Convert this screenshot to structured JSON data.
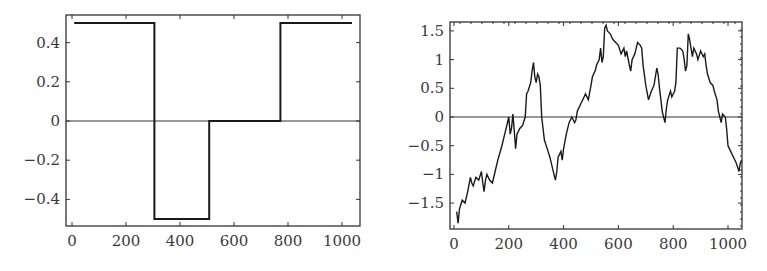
{
  "chart_data": [
    {
      "type": "line",
      "title": "",
      "xlabel": "",
      "ylabel": "",
      "xlim": [
        -20,
        1060
      ],
      "ylim": [
        -0.55,
        0.55
      ],
      "grid": false,
      "legend": null,
      "xticks": [
        0,
        200,
        400,
        600,
        800,
        1000
      ],
      "xtick_labels": [
        "0",
        "200",
        "400",
        "600",
        "800",
        "1000"
      ],
      "yticks": [
        0.4,
        0.2,
        0,
        -0.2,
        -0.4
      ],
      "ytick_labels": [
        "0.4",
        "0.2",
        "0",
        "−0.2",
        "−0.4"
      ],
      "reference_line_y": 0,
      "series": [
        {
          "name": "step signal",
          "style": "step",
          "x": [
            8,
            305,
            305,
            508,
            508,
            772,
            772,
            1037
          ],
          "y": [
            0.5,
            0.5,
            -0.5,
            -0.5,
            0,
            0,
            0.5,
            0.5
          ]
        }
      ]
    },
    {
      "type": "line",
      "title": "",
      "xlabel": "",
      "ylabel": "",
      "xlim": [
        -10,
        1050
      ],
      "ylim": [
        -1.95,
        1.7
      ],
      "grid": false,
      "legend": null,
      "xticks": [
        0,
        200,
        400,
        600,
        800,
        1000
      ],
      "xtick_labels": [
        "0",
        "200",
        "400",
        "600",
        "800",
        "1000"
      ],
      "yticks": [
        1.5,
        1,
        0.5,
        0,
        -0.5,
        -1,
        -1.5
      ],
      "ytick_labels": [
        "1.5",
        "1",
        "0.5",
        "0",
        "−0.5",
        "−1",
        "−1.5"
      ],
      "reference_line_y": 0,
      "series": [
        {
          "name": "random walk",
          "style": "line",
          "x": [
            10,
            15,
            20,
            30,
            40,
            50,
            60,
            65,
            70,
            80,
            90,
            100,
            105,
            110,
            115,
            120,
            130,
            140,
            150,
            160,
            175,
            185,
            190,
            200,
            205,
            210,
            215,
            220,
            225,
            230,
            240,
            250,
            260,
            265,
            270,
            280,
            285,
            290,
            295,
            300,
            305,
            310,
            315,
            320,
            330,
            340,
            350,
            360,
            370,
            375,
            380,
            390,
            395,
            400,
            410,
            420,
            430,
            440,
            445,
            450,
            460,
            470,
            480,
            490,
            500,
            505,
            515,
            520,
            530,
            535,
            540,
            545,
            550,
            555,
            560,
            570,
            580,
            590,
            600,
            610,
            620,
            625,
            630,
            640,
            645,
            650,
            660,
            670,
            680,
            685,
            690,
            700,
            710,
            720,
            730,
            740,
            745,
            750,
            755,
            760,
            770,
            775,
            780,
            790,
            795,
            800,
            805,
            810,
            815,
            825,
            835,
            840,
            845,
            850,
            855,
            860,
            870,
            875,
            885,
            890,
            900,
            910,
            915,
            920,
            925,
            935,
            945,
            950,
            960,
            965,
            975,
            980,
            990,
            995,
            1000,
            1010,
            1020,
            1030,
            1040,
            1045,
            1050
          ],
          "y": [
            -1.65,
            -1.85,
            -1.6,
            -1.45,
            -1.5,
            -1.3,
            -1.05,
            -1.15,
            -1.2,
            -1.05,
            -1.1,
            -0.95,
            -1.15,
            -1.3,
            -1.1,
            -1.0,
            -1.1,
            -1.15,
            -0.95,
            -0.75,
            -0.5,
            -0.3,
            -0.2,
            0.0,
            -0.3,
            -0.2,
            0.05,
            -0.25,
            -0.55,
            -0.3,
            -0.2,
            -0.15,
            0.0,
            0.4,
            0.45,
            0.6,
            0.8,
            0.95,
            0.7,
            0.6,
            0.75,
            0.7,
            0.55,
            0.0,
            -0.4,
            -0.55,
            -0.7,
            -0.9,
            -1.1,
            -0.95,
            -0.7,
            -0.6,
            -0.75,
            -0.55,
            -0.3,
            -0.1,
            0.0,
            -0.1,
            -0.05,
            0.1,
            0.2,
            0.3,
            0.4,
            0.3,
            0.55,
            0.7,
            0.8,
            0.9,
            1.0,
            1.2,
            0.95,
            1.05,
            1.55,
            1.6,
            1.5,
            1.45,
            1.35,
            1.3,
            1.25,
            1.1,
            1.2,
            1.05,
            1.15,
            0.9,
            0.8,
            1.0,
            1.1,
            1.3,
            1.25,
            1.2,
            0.9,
            0.55,
            0.3,
            0.45,
            0.55,
            0.85,
            0.75,
            0.5,
            0.3,
            0.1,
            -0.1,
            0.15,
            0.3,
            0.45,
            0.35,
            0.4,
            0.45,
            0.6,
            1.2,
            1.2,
            1.15,
            1.0,
            0.8,
            0.9,
            1.45,
            1.35,
            1.05,
            1.2,
            1.1,
            1.0,
            1.15,
            1.05,
            1.1,
            0.9,
            0.75,
            0.6,
            0.55,
            0.45,
            0.3,
            0.1,
            -0.1,
            0.05,
            0.0,
            -0.2,
            -0.5,
            -0.6,
            -0.7,
            -0.8,
            -0.95,
            -0.8,
            -0.75
          ]
        }
      ]
    }
  ],
  "left_chart": {
    "plot_box": {
      "x0": 66,
      "y0": 15,
      "x1": 360,
      "y1": 226
    },
    "px_per_x": 0.27,
    "x0_px": 72,
    "y_zero_px": 121,
    "px_per_y": 196
  },
  "right_chart": {
    "plot_box": {
      "x0": 450,
      "y0": 22,
      "x1": 742,
      "y1": 229
    },
    "px_per_x": 0.274,
    "x0_px": 454,
    "y_zero_px": 117,
    "px_per_y": 57.4
  },
  "colors": {
    "line": "#1a1a1a",
    "axis": "#333333",
    "text": "#3a3a3a"
  }
}
